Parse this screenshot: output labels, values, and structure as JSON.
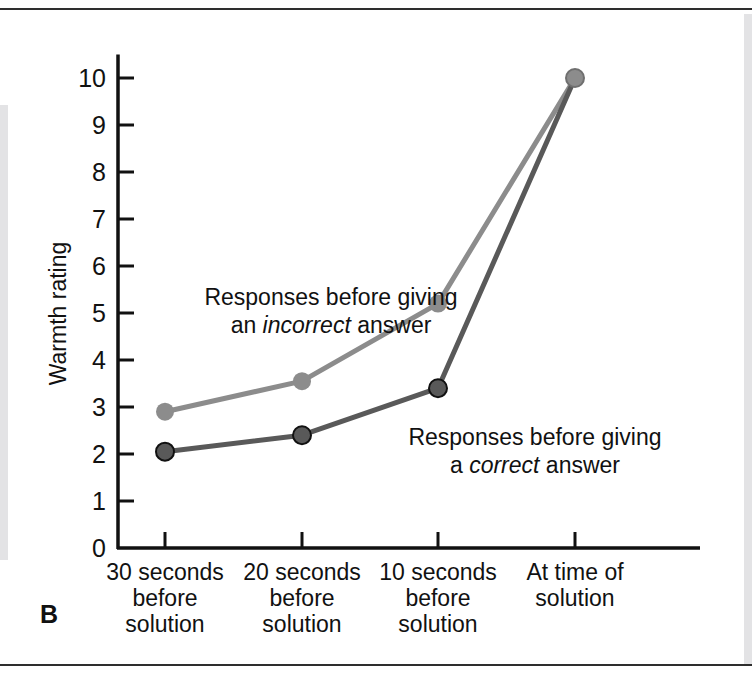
{
  "panel": {
    "letter": "B"
  },
  "chart_data": {
    "type": "line",
    "title": "",
    "xlabel": "",
    "ylabel": "Warmth rating",
    "ylim": [
      0,
      10.5
    ],
    "yticks": [
      0,
      1,
      2,
      3,
      4,
      5,
      6,
      7,
      8,
      9,
      10
    ],
    "grid": false,
    "legend_position": "inline-annotations",
    "categories": [
      "30 seconds before solution",
      "20 seconds before solution",
      "10 seconds before solution",
      "At time of solution"
    ],
    "category_lines": [
      [
        "30 seconds",
        "before",
        "solution"
      ],
      [
        "20 seconds",
        "before",
        "solution"
      ],
      [
        "10 seconds",
        "before",
        "solution"
      ],
      [
        "At time of",
        "solution"
      ]
    ],
    "series": [
      {
        "name": "Responses before giving an incorrect answer",
        "values": [
          2.9,
          3.55,
          5.2,
          10.0
        ],
        "color": "#8c8c8c"
      },
      {
        "name": "Responses before giving a correct answer",
        "values": [
          2.05,
          2.4,
          3.4,
          10.0
        ],
        "color": "#595959"
      }
    ],
    "annotations": [
      {
        "id": "incorrect",
        "line1": "Responses before giving",
        "line2_pre": "an ",
        "line2_em": "incorrect",
        "line2_post": " answer"
      },
      {
        "id": "correct",
        "line1": "Responses before giving",
        "line2_pre": "a ",
        "line2_em": "correct",
        "line2_post": " answer"
      }
    ]
  },
  "colors": {
    "axis": "#111111",
    "series_incorrect": "#8c8c8c",
    "series_correct": "#595959",
    "rule": "#2e2e2e"
  }
}
